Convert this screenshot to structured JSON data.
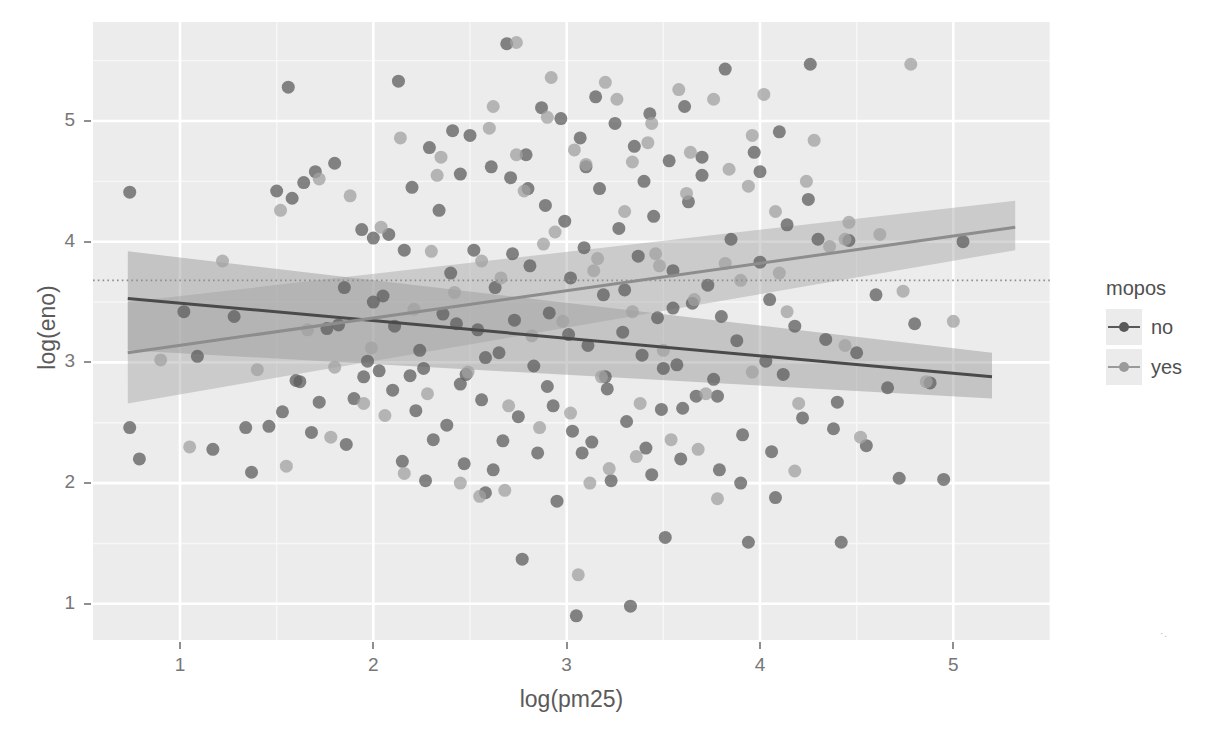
{
  "chart_data": {
    "type": "scatter",
    "title": "",
    "xlabel": "log(pm25)",
    "ylabel": "log(eno)",
    "xlim": [
      0.55,
      5.5
    ],
    "ylim": [
      0.7,
      5.82
    ],
    "xticks": [
      1,
      2,
      3,
      4,
      5
    ],
    "yticks": [
      1,
      2,
      3,
      4,
      5
    ],
    "xtick_labels": [
      "1",
      "2",
      "3",
      "4",
      "5"
    ],
    "ytick_labels": [
      "1",
      "2",
      "3",
      "4",
      "5"
    ],
    "grid": true,
    "grid_major_color": "#ffffff",
    "grid_minor_color": "#f7f7f7",
    "panel_background": "#ececed",
    "legend": {
      "position": "right",
      "title": "mopos",
      "entries": [
        {
          "label": "no",
          "color": "#595959",
          "key": "line-with-point"
        },
        {
          "label": "yes",
          "color": "#9a9a9a",
          "key": "line-with-point"
        }
      ]
    },
    "reference_line": {
      "type": "horizontal-dotted",
      "y": 3.68,
      "color": "#8e8e8e"
    },
    "series": [
      {
        "name": "no",
        "color": "#5e5e5e",
        "point_alpha": 0.75,
        "point_radius": 6.5,
        "fit": {
          "type": "linear",
          "x_start": 0.73,
          "y_start": 3.53,
          "x_end": 5.2,
          "y_end": 2.88,
          "band_color": "#8c8c8c",
          "band_alpha": 0.42,
          "band_start_lower": 3.1,
          "band_start_upper": 3.92,
          "band_end_lower": 2.7,
          "band_end_upper": 3.08
        },
        "points": [
          [
            0.74,
            4.41
          ],
          [
            0.74,
            2.46
          ],
          [
            0.79,
            2.2
          ],
          [
            1.02,
            3.42
          ],
          [
            1.09,
            3.05
          ],
          [
            1.17,
            2.28
          ],
          [
            1.28,
            3.38
          ],
          [
            1.34,
            2.46
          ],
          [
            1.37,
            2.09
          ],
          [
            1.46,
            2.47
          ],
          [
            1.5,
            4.42
          ],
          [
            1.53,
            2.59
          ],
          [
            1.56,
            5.28
          ],
          [
            1.58,
            4.36
          ],
          [
            1.6,
            2.85
          ],
          [
            1.62,
            2.84
          ],
          [
            1.64,
            4.49
          ],
          [
            1.68,
            2.42
          ],
          [
            1.7,
            4.58
          ],
          [
            1.72,
            2.67
          ],
          [
            1.76,
            3.28
          ],
          [
            1.8,
            4.65
          ],
          [
            1.82,
            3.31
          ],
          [
            1.86,
            2.32
          ],
          [
            1.9,
            2.7
          ],
          [
            1.94,
            4.1
          ],
          [
            1.97,
            3.01
          ],
          [
            2.0,
            4.03
          ],
          [
            2.03,
            2.93
          ],
          [
            2.05,
            3.55
          ],
          [
            2.08,
            4.06
          ],
          [
            2.11,
            3.3
          ],
          [
            2.13,
            5.33
          ],
          [
            2.16,
            3.93
          ],
          [
            2.19,
            2.89
          ],
          [
            2.22,
            2.6
          ],
          [
            2.24,
            3.1
          ],
          [
            2.27,
            2.02
          ],
          [
            2.29,
            4.78
          ],
          [
            2.31,
            2.36
          ],
          [
            2.34,
            4.26
          ],
          [
            2.36,
            3.4
          ],
          [
            2.38,
            2.48
          ],
          [
            2.41,
            4.92
          ],
          [
            2.43,
            3.32
          ],
          [
            2.45,
            2.82
          ],
          [
            2.47,
            2.16
          ],
          [
            2.5,
            4.88
          ],
          [
            2.52,
            3.93
          ],
          [
            2.54,
            3.27
          ],
          [
            2.56,
            2.69
          ],
          [
            2.58,
            1.92
          ],
          [
            2.61,
            4.62
          ],
          [
            2.63,
            3.62
          ],
          [
            2.65,
            3.08
          ],
          [
            2.67,
            2.35
          ],
          [
            2.69,
            5.64
          ],
          [
            2.71,
            4.53
          ],
          [
            2.73,
            3.35
          ],
          [
            2.75,
            2.55
          ],
          [
            2.77,
            1.37
          ],
          [
            2.79,
            4.72
          ],
          [
            2.81,
            3.8
          ],
          [
            2.83,
            2.97
          ],
          [
            2.85,
            2.25
          ],
          [
            2.87,
            5.11
          ],
          [
            2.89,
            4.3
          ],
          [
            2.91,
            3.41
          ],
          [
            2.93,
            2.64
          ],
          [
            2.95,
            1.85
          ],
          [
            2.97,
            5.02
          ],
          [
            2.99,
            4.17
          ],
          [
            3.01,
            3.23
          ],
          [
            3.03,
            2.43
          ],
          [
            3.05,
            0.9
          ],
          [
            3.07,
            4.86
          ],
          [
            3.09,
            3.95
          ],
          [
            3.11,
            3.14
          ],
          [
            3.13,
            2.34
          ],
          [
            3.15,
            5.2
          ],
          [
            3.17,
            4.44
          ],
          [
            3.19,
            3.56
          ],
          [
            3.21,
            2.78
          ],
          [
            3.23,
            2.02
          ],
          [
            3.25,
            4.98
          ],
          [
            3.27,
            4.11
          ],
          [
            3.29,
            3.25
          ],
          [
            3.31,
            2.51
          ],
          [
            3.33,
            0.98
          ],
          [
            3.35,
            4.79
          ],
          [
            3.37,
            3.88
          ],
          [
            3.39,
            3.06
          ],
          [
            3.41,
            2.29
          ],
          [
            3.43,
            5.06
          ],
          [
            3.45,
            4.21
          ],
          [
            3.47,
            3.37
          ],
          [
            3.49,
            2.61
          ],
          [
            3.51,
            1.55
          ],
          [
            3.53,
            4.67
          ],
          [
            3.55,
            3.76
          ],
          [
            3.57,
            2.98
          ],
          [
            3.59,
            2.2
          ],
          [
            3.61,
            5.12
          ],
          [
            3.63,
            4.33
          ],
          [
            3.65,
            3.49
          ],
          [
            3.67,
            2.72
          ],
          [
            3.7,
            4.55
          ],
          [
            3.73,
            3.64
          ],
          [
            3.76,
            2.86
          ],
          [
            3.79,
            2.11
          ],
          [
            3.82,
            5.43
          ],
          [
            3.85,
            4.02
          ],
          [
            3.88,
            3.18
          ],
          [
            3.91,
            2.4
          ],
          [
            3.94,
            1.51
          ],
          [
            3.97,
            4.74
          ],
          [
            4.0,
            3.83
          ],
          [
            4.03,
            3.01
          ],
          [
            4.06,
            2.26
          ],
          [
            4.1,
            4.91
          ],
          [
            4.14,
            4.14
          ],
          [
            4.18,
            3.3
          ],
          [
            4.22,
            2.54
          ],
          [
            4.26,
            5.47
          ],
          [
            4.3,
            4.02
          ],
          [
            4.34,
            3.19
          ],
          [
            4.38,
            2.45
          ],
          [
            4.42,
            1.51
          ],
          [
            4.46,
            4.01
          ],
          [
            4.5,
            3.08
          ],
          [
            4.55,
            2.31
          ],
          [
            4.6,
            3.56
          ],
          [
            4.66,
            2.79
          ],
          [
            4.72,
            2.04
          ],
          [
            4.8,
            3.32
          ],
          [
            4.88,
            2.83
          ],
          [
            4.95,
            2.03
          ],
          [
            5.05,
            4.0
          ],
          [
            2.1,
            2.77
          ],
          [
            2.15,
            2.18
          ],
          [
            2.48,
            2.9
          ],
          [
            2.62,
            2.11
          ],
          [
            3.08,
            2.25
          ],
          [
            3.44,
            2.07
          ],
          [
            3.6,
            2.62
          ],
          [
            3.9,
            2.0
          ],
          [
            4.08,
            1.88
          ],
          [
            1.85,
            3.62
          ],
          [
            2.0,
            3.5
          ],
          [
            2.4,
            3.74
          ],
          [
            2.72,
            3.9
          ],
          [
            3.02,
            3.7
          ],
          [
            3.3,
            3.6
          ],
          [
            3.55,
            3.45
          ],
          [
            3.8,
            3.38
          ],
          [
            4.05,
            3.52
          ],
          [
            2.2,
            4.45
          ],
          [
            2.45,
            4.56
          ],
          [
            2.8,
            4.44
          ],
          [
            3.1,
            4.62
          ],
          [
            3.4,
            4.5
          ],
          [
            3.7,
            4.7
          ],
          [
            4.0,
            4.58
          ],
          [
            4.25,
            4.35
          ],
          [
            1.95,
            2.88
          ],
          [
            2.26,
            2.95
          ],
          [
            2.58,
            3.04
          ],
          [
            2.9,
            2.8
          ],
          [
            3.2,
            2.88
          ],
          [
            3.5,
            2.95
          ],
          [
            3.78,
            2.72
          ],
          [
            4.12,
            2.9
          ],
          [
            4.4,
            2.67
          ]
        ]
      },
      {
        "name": "yes",
        "color": "#a2a2a2",
        "point_alpha": 0.75,
        "point_radius": 6.5,
        "fit": {
          "type": "linear",
          "x_start": 0.73,
          "y_start": 3.08,
          "x_end": 5.32,
          "y_end": 4.12,
          "band_color": "#9d9d9d",
          "band_alpha": 0.42,
          "band_start_lower": 2.66,
          "band_start_upper": 3.5,
          "band_end_lower": 3.93,
          "band_end_upper": 4.34
        },
        "points": [
          [
            0.9,
            3.02
          ],
          [
            1.05,
            2.3
          ],
          [
            1.22,
            3.84
          ],
          [
            1.4,
            2.94
          ],
          [
            1.55,
            2.14
          ],
          [
            1.66,
            3.27
          ],
          [
            1.78,
            2.38
          ],
          [
            1.88,
            4.38
          ],
          [
            1.99,
            3.12
          ],
          [
            2.06,
            2.56
          ],
          [
            2.14,
            4.86
          ],
          [
            2.21,
            3.44
          ],
          [
            2.28,
            2.74
          ],
          [
            2.35,
            4.7
          ],
          [
            2.42,
            3.58
          ],
          [
            2.49,
            2.92
          ],
          [
            2.55,
            1.89
          ],
          [
            2.6,
            4.94
          ],
          [
            2.66,
            3.7
          ],
          [
            2.7,
            2.64
          ],
          [
            2.74,
            5.65
          ],
          [
            2.78,
            4.42
          ],
          [
            2.82,
            3.22
          ],
          [
            2.86,
            2.46
          ],
          [
            2.9,
            5.03
          ],
          [
            2.94,
            4.08
          ],
          [
            2.98,
            3.34
          ],
          [
            3.02,
            2.58
          ],
          [
            3.06,
            1.24
          ],
          [
            3.1,
            4.64
          ],
          [
            3.14,
            3.76
          ],
          [
            3.18,
            2.88
          ],
          [
            3.22,
            2.12
          ],
          [
            3.26,
            5.18
          ],
          [
            3.3,
            4.25
          ],
          [
            3.34,
            3.42
          ],
          [
            3.38,
            2.66
          ],
          [
            3.42,
            4.82
          ],
          [
            3.46,
            3.9
          ],
          [
            3.5,
            3.1
          ],
          [
            3.54,
            2.36
          ],
          [
            3.58,
            5.26
          ],
          [
            3.62,
            4.4
          ],
          [
            3.66,
            3.52
          ],
          [
            3.72,
            2.74
          ],
          [
            3.78,
            1.87
          ],
          [
            3.84,
            4.6
          ],
          [
            3.9,
            3.68
          ],
          [
            3.96,
            2.92
          ],
          [
            4.02,
            5.22
          ],
          [
            4.08,
            4.25
          ],
          [
            4.14,
            3.42
          ],
          [
            4.2,
            2.66
          ],
          [
            4.28,
            4.84
          ],
          [
            4.36,
            3.96
          ],
          [
            4.44,
            3.14
          ],
          [
            4.52,
            2.38
          ],
          [
            4.62,
            4.06
          ],
          [
            4.74,
            3.59
          ],
          [
            4.86,
            2.84
          ],
          [
            5.0,
            3.34
          ],
          [
            4.78,
            5.47
          ],
          [
            4.44,
            4.02
          ],
          [
            4.46,
            4.16
          ],
          [
            3.96,
            4.88
          ],
          [
            3.76,
            5.18
          ],
          [
            3.44,
            4.98
          ],
          [
            3.2,
            5.32
          ],
          [
            2.92,
            5.36
          ],
          [
            2.62,
            5.12
          ],
          [
            2.33,
            4.55
          ],
          [
            2.04,
            4.12
          ],
          [
            1.72,
            4.52
          ],
          [
            1.52,
            4.26
          ],
          [
            2.45,
            2.0
          ],
          [
            2.68,
            1.94
          ],
          [
            3.12,
            2.0
          ],
          [
            3.36,
            2.22
          ],
          [
            3.68,
            2.28
          ],
          [
            4.18,
            2.1
          ],
          [
            2.16,
            2.08
          ],
          [
            1.95,
            2.66
          ],
          [
            1.8,
            2.96
          ],
          [
            2.3,
            3.92
          ],
          [
            2.56,
            3.84
          ],
          [
            2.88,
            3.98
          ],
          [
            3.16,
            3.86
          ],
          [
            3.48,
            3.8
          ],
          [
            3.82,
            3.82
          ],
          [
            4.1,
            3.74
          ],
          [
            2.74,
            4.72
          ],
          [
            3.04,
            4.76
          ],
          [
            3.34,
            4.66
          ],
          [
            3.64,
            4.74
          ],
          [
            3.94,
            4.46
          ],
          [
            4.24,
            4.5
          ]
        ]
      }
    ]
  },
  "axis": {
    "xlabel": "log(pm25)",
    "ylabel": "log(eno)"
  },
  "legend": {
    "title": "mopos",
    "no_label": "no",
    "yes_label": "yes"
  },
  "ticks": {
    "x": [
      "1",
      "2",
      "3",
      "4",
      "5"
    ],
    "y": [
      "1",
      "2",
      "3",
      "4",
      "5"
    ]
  },
  "corner": {
    "mark": "·."
  }
}
